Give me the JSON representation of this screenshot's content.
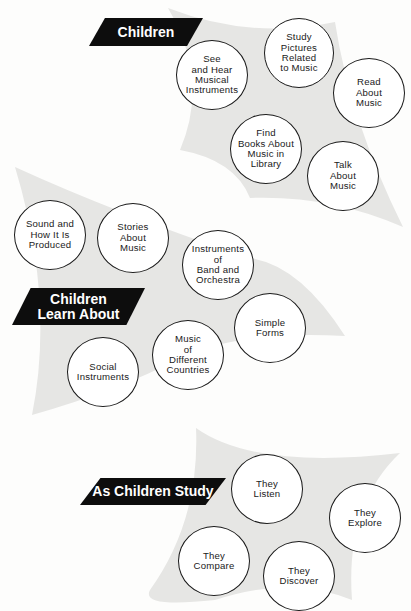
{
  "colors": {
    "shape_fill": "#e6e6e4",
    "banner_bg": "#0d0d0d",
    "banner_text": "#ffffff",
    "circle_border": "#1a1a1a"
  },
  "sections": [
    {
      "banner": "Children",
      "items": [
        "See\nand Hear\nMusical\nInstruments",
        "Study\nPictures\nRelated\nto Music",
        "Read\nAbout\nMusic",
        "Find\nBooks About\nMusic in\nLibrary",
        "Talk\nAbout\nMusic"
      ]
    },
    {
      "banner": "Children\nLearn About",
      "items": [
        "Sound and\nHow It Is\nProduced",
        "Stories\nAbout\nMusic",
        "Instruments\nof\nBand and\nOrchestra",
        "Simple\nForms",
        "Music\nof\nDifferent\nCountries",
        "Social\nInstruments"
      ]
    },
    {
      "banner": "As Children Study",
      "items": [
        "They\nListen",
        "They\nExplore",
        "They\nCompare",
        "They\nDiscover"
      ]
    }
  ]
}
